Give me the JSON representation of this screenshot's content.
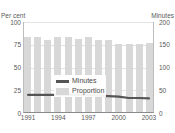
{
  "chart_data": {
    "type": "bar",
    "title": "",
    "categories": [
      "1991",
      "1992",
      "1993",
      "1994",
      "1995",
      "1996",
      "1997",
      "1998",
      "1999",
      "2000",
      "2001",
      "2002",
      "2003"
    ],
    "xlabel": "",
    "ylabel": "Per cent",
    "ylabel_right": "Minutes",
    "ylim": [
      0,
      100
    ],
    "ylim_right": [
      0,
      200
    ],
    "yticks": [
      100,
      75,
      50,
      25,
      0
    ],
    "yticks_right": [
      200,
      150,
      100,
      50,
      0
    ],
    "xticks_shown": [
      "1991",
      "1994",
      "1997",
      "2000",
      "2003"
    ],
    "grid": true,
    "legend_position": "inside-left",
    "series": [
      {
        "name": "Proportion",
        "type": "bar",
        "axis": "left",
        "unit": "Per cent",
        "color": "#d8d8d8",
        "values": [
          83,
          83,
          80,
          83,
          83,
          81,
          83,
          80,
          80,
          76,
          76,
          76,
          77
        ]
      },
      {
        "name": "Minutes",
        "type": "line",
        "axis": "right",
        "unit": "Minutes",
        "color": "#555555",
        "values": [
          40,
          40,
          40,
          40,
          41,
          40,
          39,
          38,
          37,
          36,
          33,
          33,
          32
        ]
      }
    ]
  },
  "axes": {
    "left_title": "Per cent",
    "right_title": "Minutes"
  },
  "legend": {
    "items": [
      {
        "label": "Minutes",
        "swatch": "line-swatch"
      },
      {
        "label": "Proportion",
        "swatch": "box-swatch"
      }
    ]
  },
  "colors": {
    "bar": "#d8d8d8",
    "line": "#555555",
    "grid": "#e3e3e3",
    "axis": "#8a8a8a",
    "text": "#4a4a4a",
    "background": "#ffffff"
  }
}
